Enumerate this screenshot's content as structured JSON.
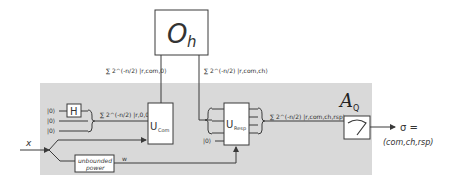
{
  "oracle": {
    "label": "O",
    "subscript": "h"
  },
  "adversary": {
    "label": "A",
    "subscript": "Q"
  },
  "wires": {
    "oracle_in": "∑ 2^(-n/2) |r,com,0⟩",
    "oracle_out": "∑ 2^(-n/2) |r,com,ch⟩",
    "hadamard_out": "∑ 2^(-n/2) |r,0,0⟩",
    "resp_out": "∑ 2^(-n/2) |r,com,ch,rsp⟩",
    "advice": "w"
  },
  "inputs": {
    "qubits": [
      "|0⟩",
      "|0⟩",
      "|0⟩"
    ],
    "resp_ancilla": "|0⟩",
    "x": "x"
  },
  "gates": {
    "hadamard": "H",
    "u_com": {
      "main": "U",
      "sub": "Com"
    },
    "u_resp": {
      "main": "U",
      "sub": "Resp"
    },
    "unbounded": [
      "unbounded",
      "power"
    ]
  },
  "output": {
    "line1": "σ =",
    "line2": "(com,ch,rsp)"
  },
  "colors": {
    "region": "#d9d9d9",
    "stroke": "#3a3a3a",
    "box": "#ffffff"
  }
}
